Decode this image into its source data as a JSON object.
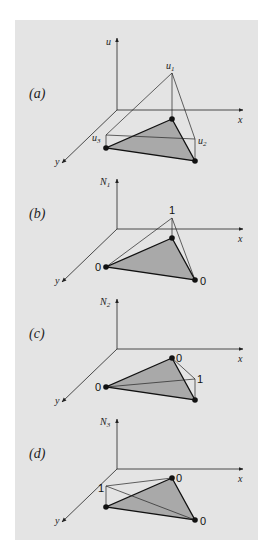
{
  "figure": {
    "background_color": "#ffffff",
    "panel_color": "#e4e4e4",
    "triangle_fill": "#a9a9a9",
    "line_color": "#222222"
  },
  "panels": [
    {
      "id": "a",
      "label": "(a)",
      "vertical_axis_label": "u",
      "x_axis_label": "x",
      "y_axis_label": "y",
      "node_labels": {
        "apex1": "u1",
        "node2": "u2",
        "node3": "u3"
      }
    },
    {
      "id": "b",
      "label": "(b)",
      "vertical_axis_label": "N1",
      "x_axis_label": "x",
      "y_axis_label": "y",
      "node_values": {
        "node1": "1",
        "node2": "0",
        "node3": "0"
      }
    },
    {
      "id": "c",
      "label": "(c)",
      "vertical_axis_label": "N2",
      "x_axis_label": "x",
      "y_axis_label": "y",
      "node_values": {
        "node1": "0",
        "node2": "1",
        "node3": "0"
      }
    },
    {
      "id": "d",
      "label": "(d)",
      "vertical_axis_label": "N3",
      "x_axis_label": "x",
      "y_axis_label": "y",
      "node_values": {
        "node1": "0",
        "node2": "0",
        "node3": "1"
      }
    }
  ]
}
